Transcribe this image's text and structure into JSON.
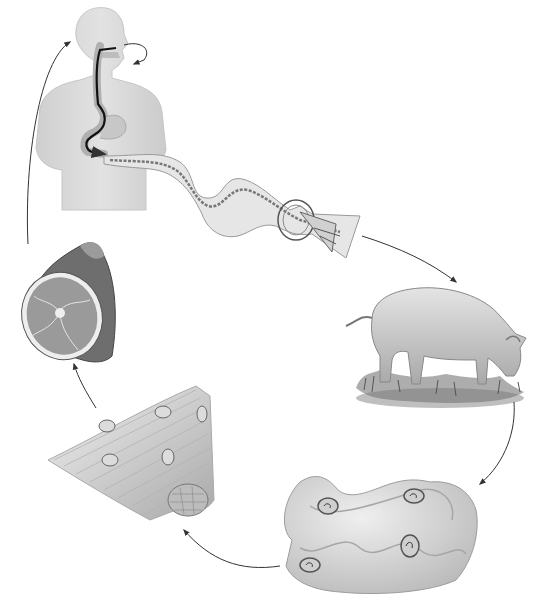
{
  "diagram": {
    "type": "parasite-life-cycle",
    "labels_visible": false,
    "colors": {
      "background": "#ffffff",
      "arrow": "#333333",
      "body_fill": "#d9d9d9",
      "body_shade": "#c4c4c4",
      "tract": "#111111",
      "worm_fill": "#e6e6e6",
      "pig_fill": "#cfcfcf",
      "grass": "#6b6b6b",
      "meat_cut": "#9a9a9a",
      "meat_fat": "#eeeeee",
      "gut_fill": "#d4d4d4",
      "cyst": "#555555",
      "muscle": "#bdbdbd"
    },
    "stages": [
      {
        "id": "human-host",
        "description": "Human torso with digestive tract; arrow from mouth down to intestine"
      },
      {
        "id": "adult-worm",
        "description": "Segmented tapeworm emerging from small intestine with scolex enlargement"
      },
      {
        "id": "pig-host",
        "description": "Pig grazing on grass"
      },
      {
        "id": "intestine-cysts",
        "description": "Coiled intestine with larval cysts"
      },
      {
        "id": "muscle-cysts",
        "description": "Muscle fiber bundle with encysted larvae"
      },
      {
        "id": "pork-meat",
        "description": "Cut of pork (ham)"
      }
    ],
    "cycle_order": [
      "human-host",
      "adult-worm",
      "pig-host",
      "intestine-cysts",
      "muscle-cysts",
      "pork-meat",
      "human-host"
    ]
  }
}
